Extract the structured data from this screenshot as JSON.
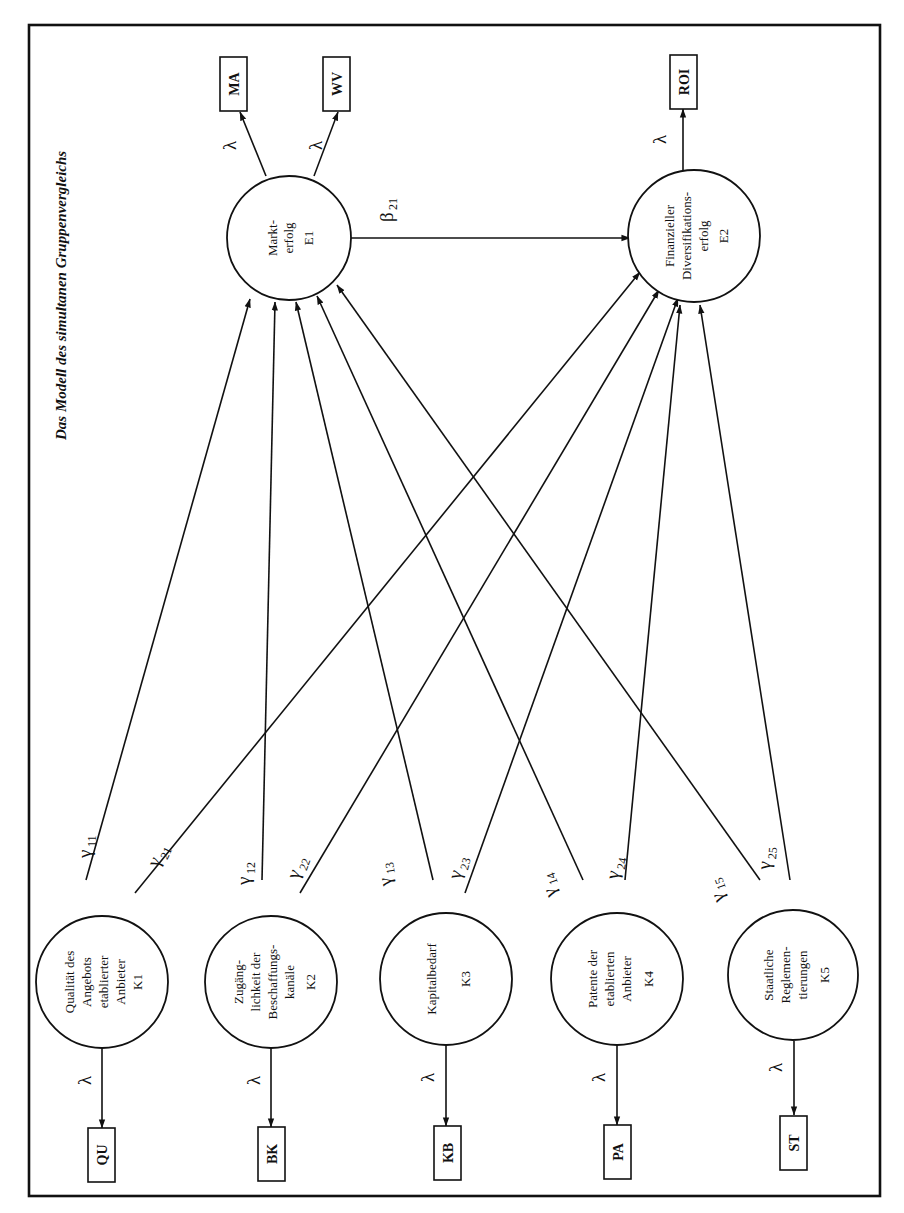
{
  "figure": {
    "title": "Das Modell des simultanen Gruppenvergleichs",
    "orientation": "rotated 90° counter-clockwise"
  },
  "endogenous": [
    {
      "id": "E1",
      "lines": [
        "Markt-",
        "erfolg",
        "E1"
      ],
      "indicators": [
        {
          "label": "MA",
          "loading": "λ"
        },
        {
          "label": "WV",
          "loading": "λ"
        }
      ]
    },
    {
      "id": "E2",
      "lines": [
        "Finanzieller",
        "Diversifikations-",
        "erfolg",
        "E2"
      ],
      "indicators": [
        {
          "label": "ROI",
          "loading": "λ"
        }
      ]
    }
  ],
  "exogenous": [
    {
      "id": "K1",
      "lines": [
        "Qualität des",
        "Angebots",
        "etablierter",
        "Anbieter",
        "K1"
      ],
      "indicator": "QU",
      "loading": "λ",
      "gamma_to_E1": "γ11",
      "gamma_to_E2": "γ21"
    },
    {
      "id": "K2",
      "lines": [
        "Zugäng-",
        "lichkeit der",
        "Beschaffungs-",
        "kanäle",
        "K2"
      ],
      "indicator": "BK",
      "loading": "λ",
      "gamma_to_E1": "γ12",
      "gamma_to_E2": "γ22"
    },
    {
      "id": "K3",
      "lines": [
        "Kapitalbedarf",
        "K3"
      ],
      "indicator": "KB",
      "loading": "λ",
      "gamma_to_E1": "γ13",
      "gamma_to_E2": "γ23"
    },
    {
      "id": "K4",
      "lines": [
        "Patente der",
        "etablierten",
        "Anbieter",
        "K4"
      ],
      "indicator": "PA",
      "loading": "λ",
      "gamma_to_E1": "γ14",
      "gamma_to_E2": "γ24"
    },
    {
      "id": "K5",
      "lines": [
        "Staatliche",
        "Reglemen-",
        "tierungen",
        "K5"
      ],
      "indicator": "ST",
      "loading": "λ",
      "gamma_to_E1": "γ15",
      "gamma_to_E2": "γ25"
    }
  ],
  "paths": {
    "beta": {
      "symbol": "β",
      "sub": "21",
      "from": "E1",
      "to": "E2"
    },
    "gammas": [
      {
        "symbol": "γ",
        "sub": "11"
      },
      {
        "symbol": "γ",
        "sub": "21"
      },
      {
        "symbol": "γ",
        "sub": "12"
      },
      {
        "symbol": "γ",
        "sub": "22"
      },
      {
        "symbol": "γ",
        "sub": "13"
      },
      {
        "symbol": "γ",
        "sub": "23"
      },
      {
        "symbol": "γ",
        "sub": "14"
      },
      {
        "symbol": "γ",
        "sub": "24"
      },
      {
        "symbol": "γ",
        "sub": "15"
      },
      {
        "symbol": "γ",
        "sub": "25"
      }
    ]
  },
  "lambda_symbol": "λ"
}
